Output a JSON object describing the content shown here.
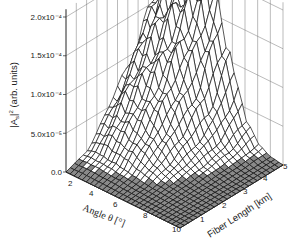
{
  "chart_data": {
    "type": "surface3d",
    "title": "",
    "x_axis": {
      "label": "Angle θ [°]",
      "ticks": [
        2,
        4,
        6,
        8,
        10
      ],
      "range": [
        1,
        10
      ]
    },
    "y_axis": {
      "label": "Fiber Length [km]",
      "ticks": [
        1,
        2,
        3,
        4,
        5
      ],
      "range": [
        0,
        5
      ]
    },
    "z_axis": {
      "label": "|A_s|² (arb. units)",
      "label_main": "|A",
      "label_sub": "s",
      "label_rest": "|",
      "label_sup": "2",
      "label_tail": " (arb. units)",
      "ticks": [
        "0.0",
        "5.0x10⁻⁵",
        "1.0x10⁻⁴",
        "1.5x10⁻⁴",
        "2.0x10⁻⁴"
      ],
      "tick_values": [
        0,
        5e-05,
        0.0001,
        0.00015,
        0.0002
      ],
      "range": [
        0,
        0.0002
      ]
    },
    "grid": true,
    "surface_color": "#ffffff",
    "mesh_color": "#111111",
    "floor_color": "#9a9a9a",
    "samples": {
      "angle": [
        1,
        2,
        3,
        4,
        5,
        6,
        7,
        8,
        9,
        10
      ],
      "fiber_km": [
        0,
        1,
        2,
        3,
        4,
        5
      ],
      "values_e4": [
        [
          0.0,
          0.0,
          0.0,
          0.0,
          0.0,
          0.0,
          0.0,
          0.0,
          0.0,
          0.0
        ],
        [
          0.1,
          0.12,
          0.1,
          0.08,
          0.05,
          0.03,
          0.02,
          0.01,
          0.0,
          0.0
        ],
        [
          0.45,
          0.55,
          0.5,
          0.4,
          0.25,
          0.12,
          0.05,
          0.02,
          0.01,
          0.0
        ],
        [
          0.9,
          1.05,
          1.0,
          0.85,
          0.55,
          0.25,
          0.1,
          0.04,
          0.01,
          0.0
        ],
        [
          1.4,
          1.6,
          1.55,
          1.35,
          0.9,
          0.45,
          0.18,
          0.06,
          0.02,
          0.0
        ],
        [
          1.75,
          2.0,
          1.85,
          1.95,
          1.6,
          0.95,
          0.4,
          0.12,
          0.03,
          0.0
        ]
      ]
    }
  }
}
